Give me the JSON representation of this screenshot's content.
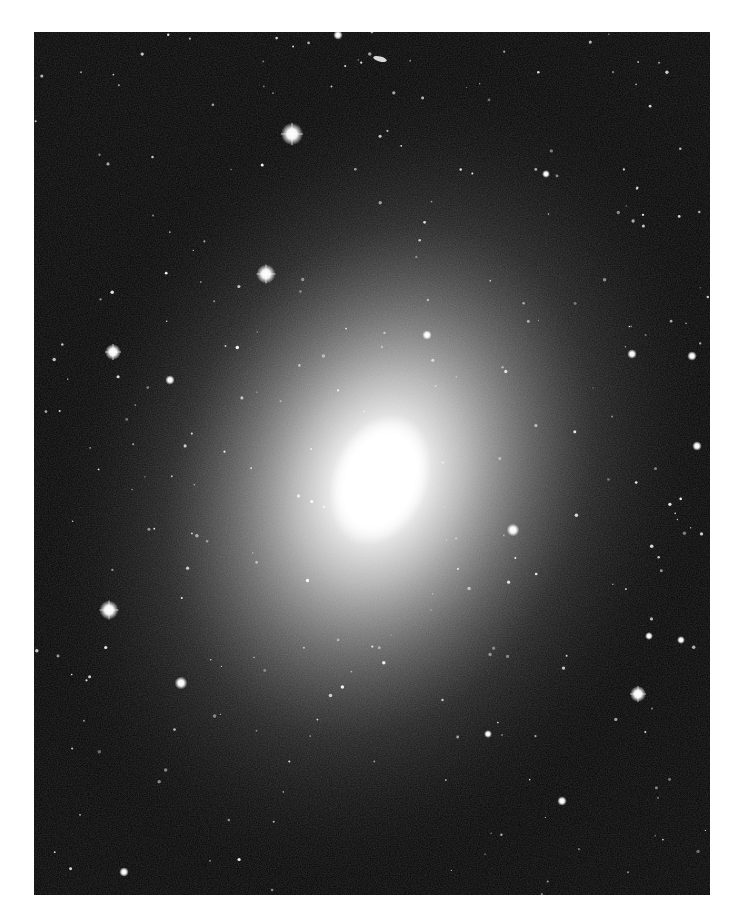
{
  "image": {
    "subject": "elliptical galaxy with surrounding foreground stars",
    "frame": {
      "x": 34,
      "y": 32,
      "width": 676,
      "height": 863
    },
    "background_color": "#0a0a0a",
    "page_color": "#ffffff",
    "galaxy_core": {
      "cx": 346,
      "cy": 448,
      "rx": 48,
      "ry": 68,
      "rotate": 22,
      "color": "#ffffff"
    },
    "galaxy_halo": {
      "cx": 346,
      "cy": 448,
      "rx": 330,
      "ry": 430,
      "rotate": 22
    },
    "background_galaxy": {
      "cx": 346,
      "cy": 27,
      "rx": 7,
      "ry": 2.5,
      "rotate": 15
    },
    "bright_stars": [
      {
        "x": 258,
        "y": 102,
        "r": 7
      },
      {
        "x": 232,
        "y": 242,
        "r": 6
      },
      {
        "x": 79,
        "y": 320,
        "r": 5
      },
      {
        "x": 75,
        "y": 578,
        "r": 6
      },
      {
        "x": 147,
        "y": 651,
        "r": 4
      },
      {
        "x": 604,
        "y": 662,
        "r": 5
      },
      {
        "x": 479,
        "y": 498,
        "r": 4
      },
      {
        "x": 393,
        "y": 303,
        "r": 3
      },
      {
        "x": 304,
        "y": 3,
        "r": 3
      },
      {
        "x": 598,
        "y": 322,
        "r": 3
      },
      {
        "x": 658,
        "y": 324,
        "r": 3
      },
      {
        "x": 663,
        "y": 414,
        "r": 3
      },
      {
        "x": 136,
        "y": 348,
        "r": 3
      },
      {
        "x": 528,
        "y": 769,
        "r": 3
      },
      {
        "x": 90,
        "y": 840,
        "r": 3
      },
      {
        "x": 512,
        "y": 142,
        "r": 2.5
      },
      {
        "x": 615,
        "y": 604,
        "r": 2.5
      },
      {
        "x": 647,
        "y": 608,
        "r": 2.5
      },
      {
        "x": 454,
        "y": 702,
        "r": 2.5
      }
    ]
  }
}
